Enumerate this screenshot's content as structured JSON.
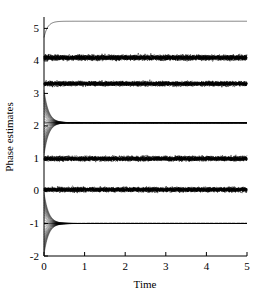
{
  "chart_data": {
    "type": "line",
    "title": "",
    "xlabel": "Time",
    "ylabel": "Phase estimates",
    "xlim": [
      0,
      5
    ],
    "ylim": [
      -2,
      5.35
    ],
    "xticks": [
      0,
      1,
      2,
      3,
      4,
      5
    ],
    "yticks": [
      -2,
      -1,
      0,
      1,
      2,
      3,
      4,
      5
    ],
    "xticklabels": [
      "0",
      "1",
      "2",
      "3",
      "4",
      "5"
    ],
    "yticklabels": [
      "-2",
      "-1",
      "0",
      "1",
      "2",
      "3",
      "4",
      "5"
    ],
    "grid": false,
    "legend": null,
    "line_color": "#000000",
    "axis_color": "#000000",
    "background": "#ffffff",
    "series": [
      {
        "name": "phase-1-smooth-top",
        "style": "smooth-converging-curve",
        "start_value": 4.72,
        "steady_value": 5.22,
        "noise_amplitude": 0.0,
        "bundle_count": 1,
        "description": "single smooth trace rising from about 4.72 at t=0 to a plateau near 5.22"
      },
      {
        "name": "phase-2-noisy-band",
        "style": "noisy-band",
        "start_value": 4.1,
        "steady_value": 4.1,
        "noise_amplitude": 0.1,
        "bundle_count": 18,
        "description": "dense noisy band centred at about 4.1"
      },
      {
        "name": "phase-3-noisy-band",
        "style": "noisy-band",
        "start_value": 3.3,
        "steady_value": 3.3,
        "noise_amplitude": 0.09,
        "bundle_count": 18,
        "description": "dense noisy band centred at about 3.3"
      },
      {
        "name": "phase-4-converging-fan",
        "style": "converging-fan",
        "start_spread": 1.05,
        "steady_value": 2.1,
        "noise_amplitude": 0.0,
        "bundle_count": 26,
        "decay_rate": 9.0,
        "description": "fan of trajectories spreading from about 1.05 to 3.15 at t=0 collapsing exponentially onto 2.1"
      },
      {
        "name": "phase-5-noisy-band",
        "style": "noisy-band",
        "start_value": 1.0,
        "steady_value": 1.0,
        "noise_amplitude": 0.09,
        "bundle_count": 18,
        "description": "dense noisy band centred at about 1.0"
      },
      {
        "name": "phase-6-noisy-band",
        "style": "noisy-band",
        "start_value": 0.05,
        "steady_value": 0.05,
        "noise_amplitude": 0.09,
        "bundle_count": 18,
        "description": "dense noisy band centred at about 0.05"
      },
      {
        "name": "phase-7-converging-fan",
        "style": "converging-fan",
        "start_spread": 1.0,
        "steady_value": -1.0,
        "noise_amplitude": 0.0,
        "bundle_count": 26,
        "decay_rate": 9.0,
        "description": "fan of trajectories spreading from about -2.0 to 0.0 at t=0 collapsing exponentially onto -1.0"
      }
    ]
  }
}
